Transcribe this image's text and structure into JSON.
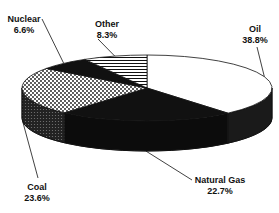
{
  "chart_data": {
    "type": "pie",
    "style": "3d",
    "title": "",
    "start": "12 o'clock, clockwise",
    "slices": [
      {
        "label": "Oil",
        "value": 38.8,
        "value_label": "38.8%",
        "fill": "white"
      },
      {
        "label": "Natural Gas",
        "value": 22.7,
        "value_label": "22.7%",
        "fill": "black"
      },
      {
        "label": "Coal",
        "value": 23.6,
        "value_label": "23.6%",
        "fill": "dotted"
      },
      {
        "label": "Nuclear",
        "value": 6.6,
        "value_label": "6.6%",
        "fill": "black"
      },
      {
        "label": "Other",
        "value": 8.3,
        "value_label": "8.3%",
        "fill": "horizontal-stripes"
      }
    ],
    "legend": "none (callout labels)"
  },
  "colors": {
    "ink": "#111111",
    "background": "#ffffff"
  }
}
